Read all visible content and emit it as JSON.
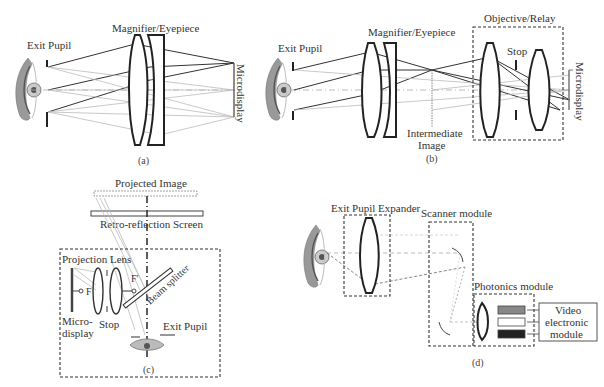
{
  "figure": {
    "panel_a": {
      "caption": "(a)",
      "labels": {
        "exit_pupil": "Exit Pupil",
        "magnifier": "Magnifier/Eyepiece",
        "microdisplay": "Microdisplay"
      }
    },
    "panel_b": {
      "caption": "(b)",
      "labels": {
        "exit_pupil": "Exit Pupil",
        "magnifier": "Magnifier/Eyepiece",
        "objective": "Objective/Relay",
        "stop": "Stop",
        "intermediate_1": "Intermediate",
        "intermediate_2": "Image",
        "microdisplay": "Microdisplay"
      }
    },
    "panel_c": {
      "caption": "(c)",
      "labels": {
        "projected_image": "Projected Image",
        "screen": "Retro-reflection Screen",
        "projection_lens": "Projection Lens",
        "beam_splitter": "Beam splitter",
        "micro_1": "Micro-",
        "micro_2": "display",
        "stop": "Stop",
        "exit_pupil": "Exit Pupil",
        "f": "F",
        "f_prime": "F'"
      }
    },
    "panel_d": {
      "caption": "(d)",
      "labels": {
        "epe": "Exit Pupil Expander",
        "scanner": "Scanner module",
        "photonics": "Photonics module",
        "video_1": "Video",
        "video_2": "electronic",
        "video_3": "module"
      },
      "colors": {
        "red_source": "#888888",
        "green_source": "#ffffff",
        "blue_source": "#222222"
      }
    }
  }
}
